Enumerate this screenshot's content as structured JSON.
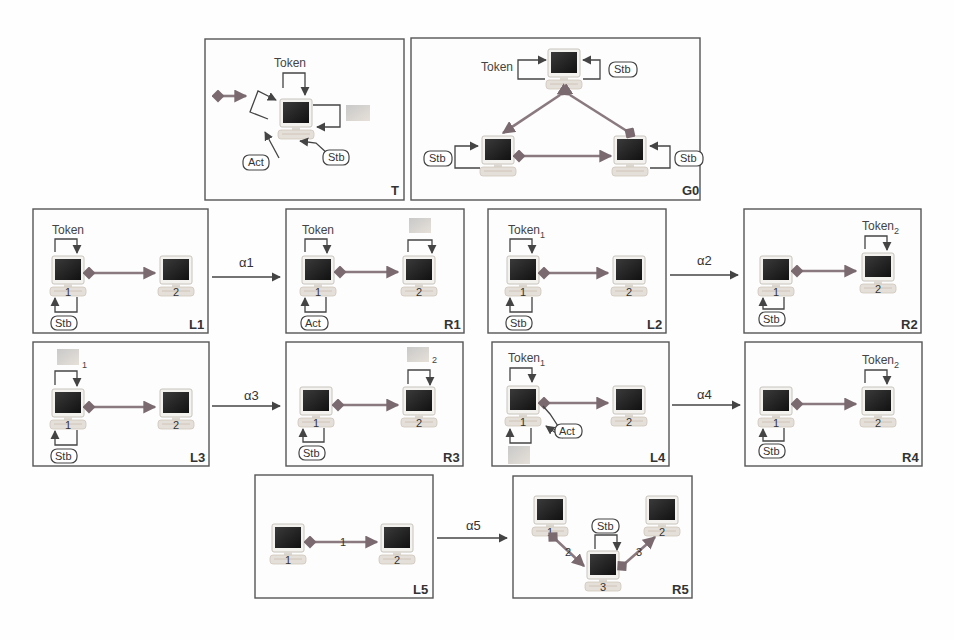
{
  "figure": {
    "panels": {
      "T": {
        "corner_label": "T",
        "token_label": "Token",
        "act_label": "Act",
        "stb_label": "Stb"
      },
      "G0": {
        "corner_label": "G0",
        "token_label": "Token",
        "stb_labels": [
          "Stb",
          "Stb",
          "Stb"
        ]
      },
      "L1": {
        "corner_label": "L1",
        "token_label": "Token",
        "stb_label": "Stb",
        "nodes": [
          "1",
          "2"
        ]
      },
      "R1": {
        "corner_label": "R1",
        "token_label": "Token",
        "act_label": "Act",
        "nodes": [
          "1",
          "2"
        ]
      },
      "L2": {
        "corner_label": "L2",
        "token_label": "Token",
        "token_sub": "1",
        "stb_label": "Stb",
        "nodes": [
          "1",
          "2"
        ]
      },
      "R2": {
        "corner_label": "R2",
        "token_label": "Token",
        "token_sub": "2",
        "stb_label": "Stb",
        "nodes": [
          "1",
          "2"
        ]
      },
      "L3": {
        "corner_label": "L3",
        "msg_sub": "1",
        "stb_label": "Stb",
        "nodes": [
          "1",
          "2"
        ]
      },
      "R3": {
        "corner_label": "R3",
        "msg_sub": "2",
        "stb_label": "Stb",
        "nodes": [
          "1",
          "2"
        ]
      },
      "L4": {
        "corner_label": "L4",
        "token_label": "Token",
        "token_sub": "1",
        "act_label": "Act",
        "nodes": [
          "1",
          "2"
        ]
      },
      "R4": {
        "corner_label": "R4",
        "token_label": "Token",
        "token_sub": "2",
        "stb_label": "Stb",
        "nodes": [
          "1",
          "2"
        ]
      },
      "L5": {
        "corner_label": "L5",
        "edge_label": "1",
        "nodes": [
          "1",
          "2"
        ]
      },
      "R5": {
        "corner_label": "R5",
        "stb_label": "Stb",
        "edge_labels": [
          "2",
          "3"
        ],
        "nodes": [
          "1",
          "2",
          "3"
        ]
      }
    },
    "rules": [
      {
        "label": "α1"
      },
      {
        "label": "α2"
      },
      {
        "label": "α3"
      },
      {
        "label": "α4"
      },
      {
        "label": "α5"
      }
    ]
  }
}
